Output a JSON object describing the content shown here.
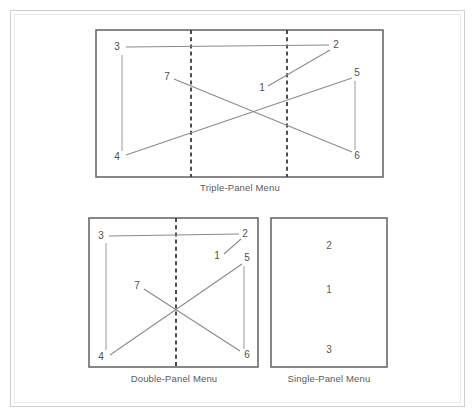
{
  "figure": {
    "background_color": "#ffffff",
    "frame_color": "#cfcfcf",
    "panel_border_color": "#6a6a6a",
    "line_color": "#8a8a8a",
    "dashed_color": "#3a3a3a",
    "label_color": "#4f4f4f"
  },
  "diagrams": [
    {
      "id": "triple-panel",
      "caption": "Triple-Panel Menu",
      "panel_count": 3,
      "dividers": 2,
      "nodes": [
        {
          "label": "3",
          "x": 120,
          "y": 50
        },
        {
          "label": "2",
          "x": 333,
          "y": 48
        },
        {
          "label": "7",
          "x": 168,
          "y": 78
        },
        {
          "label": "1",
          "x": 262,
          "y": 89
        },
        {
          "label": "5",
          "x": 357,
          "y": 74
        },
        {
          "label": "4",
          "x": 120,
          "y": 157
        },
        {
          "label": "6",
          "x": 357,
          "y": 156
        }
      ],
      "edges": [
        {
          "from": "3",
          "to": "2",
          "kind": "horizontal"
        },
        {
          "from": "3",
          "to": "4",
          "kind": "vertical"
        },
        {
          "from": "1",
          "to": "2",
          "kind": "diagonal"
        },
        {
          "from": "7",
          "to": "6",
          "kind": "diagonal"
        },
        {
          "from": "4",
          "to": "5",
          "kind": "diagonal"
        },
        {
          "from": "5",
          "to": "6",
          "kind": "vertical"
        }
      ]
    },
    {
      "id": "double-panel",
      "caption": "Double-Panel Menu",
      "panel_count": 2,
      "dividers": 1,
      "nodes": [
        {
          "label": "3",
          "x": 103,
          "y": 238
        },
        {
          "label": "2",
          "x": 243,
          "y": 236
        },
        {
          "label": "1",
          "x": 218,
          "y": 257
        },
        {
          "label": "5",
          "x": 246,
          "y": 259
        },
        {
          "label": "7",
          "x": 138,
          "y": 287
        },
        {
          "label": "4",
          "x": 103,
          "y": 357
        },
        {
          "label": "6",
          "x": 245,
          "y": 355
        }
      ],
      "edges": [
        {
          "from": "3",
          "to": "2",
          "kind": "horizontal"
        },
        {
          "from": "3",
          "to": "4",
          "kind": "vertical"
        },
        {
          "from": "1",
          "to": "2",
          "kind": "diagonal"
        },
        {
          "from": "7",
          "to": "6",
          "kind": "diagonal"
        },
        {
          "from": "4",
          "to": "5",
          "kind": "diagonal"
        },
        {
          "from": "5",
          "to": "6",
          "kind": "vertical"
        }
      ]
    },
    {
      "id": "single-panel",
      "caption": "Single-Panel Menu",
      "panel_count": 1,
      "dividers": 0,
      "nodes": [
        {
          "label": "2",
          "x": 329,
          "y": 246
        },
        {
          "label": "1",
          "x": 329,
          "y": 290
        },
        {
          "label": "3",
          "x": 329,
          "y": 350
        }
      ],
      "edges": []
    }
  ]
}
